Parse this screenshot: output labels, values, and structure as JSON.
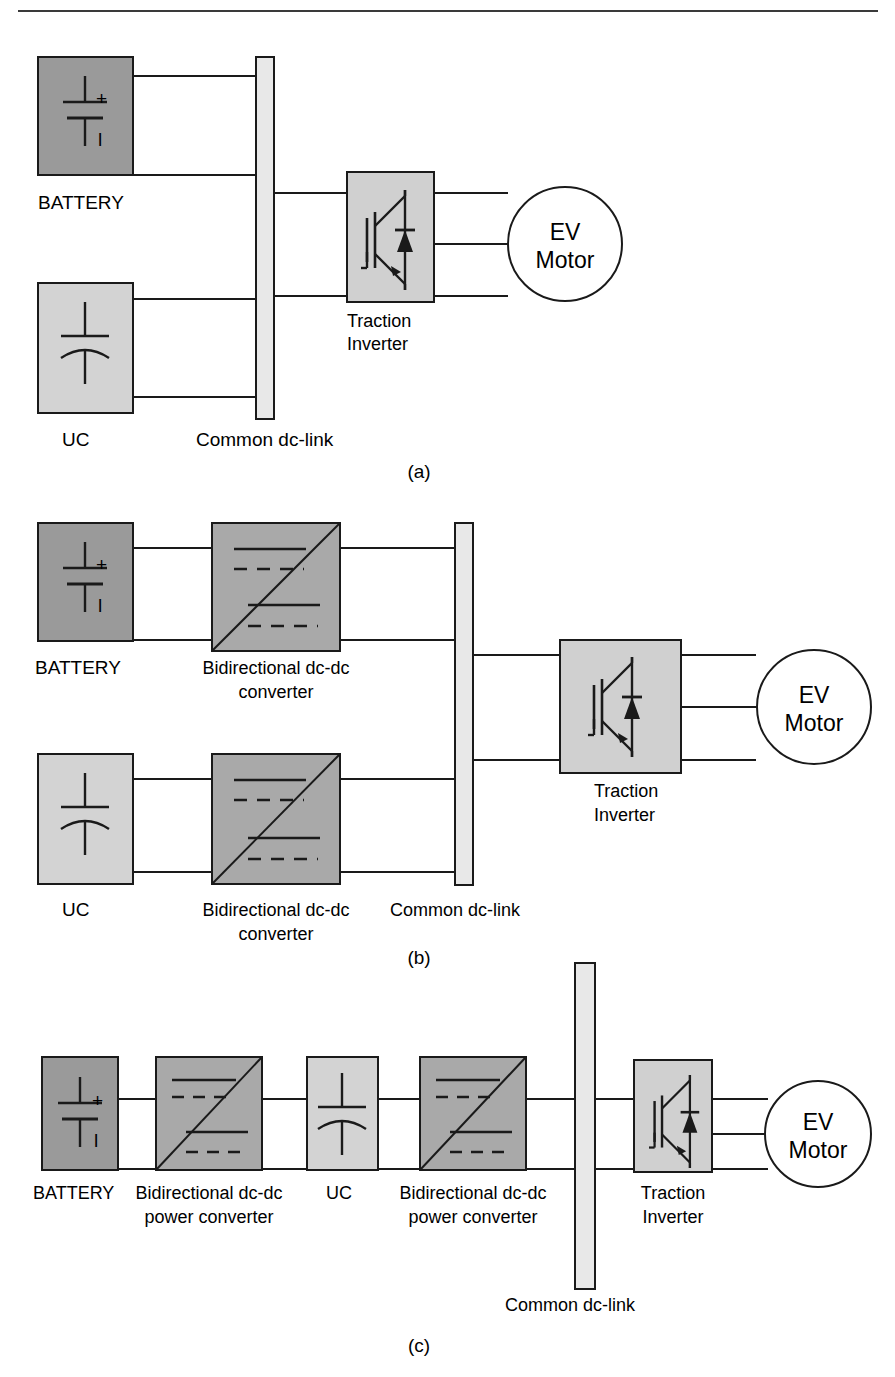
{
  "figure": {
    "top_rule": true,
    "colors": {
      "battery_fill": "#9a9a9a",
      "uc_fill": "#d3d3d3",
      "converter_fill": "#a9a9a9",
      "dclink_fill": "#e8e8e8",
      "inverter_fill": "#d0d0d0",
      "motor_fill": "#ffffff",
      "stroke": "#1a1a1a",
      "background": "#ffffff"
    },
    "panels": [
      {
        "id": "a",
        "caption": "(a)",
        "blocks": [
          {
            "name": "battery",
            "label": "BATTERY",
            "symbol": "battery-symbol",
            "plus": "+",
            "minus": "l"
          },
          {
            "name": "ultracapacitor",
            "label": "UC",
            "symbol": "ultracapacitor-symbol"
          },
          {
            "name": "dc-link",
            "label": "Common dc-link",
            "symbol": "dc-link-bus"
          },
          {
            "name": "traction-inverter",
            "label": "Traction\nInverter",
            "label_line1": "Traction",
            "label_line2": "Inverter",
            "symbol": "igbt-diode-symbol"
          },
          {
            "name": "ev-motor",
            "label_line1": "EV",
            "label_line2": "Motor",
            "symbol": "motor-circle"
          }
        ]
      },
      {
        "id": "b",
        "caption": "(b)",
        "blocks": [
          {
            "name": "battery",
            "label": "BATTERY",
            "symbol": "battery-symbol",
            "plus": "+",
            "minus": "l"
          },
          {
            "name": "battery-dcdc-converter",
            "label_line1": "Bidirectional dc-dc",
            "label_line2": "converter",
            "symbol": "bidirectional-dcdc-symbol"
          },
          {
            "name": "ultracapacitor",
            "label": "UC",
            "symbol": "ultracapacitor-symbol"
          },
          {
            "name": "uc-dcdc-converter",
            "label_line1": "Bidirectional dc-dc",
            "label_line2": "converter",
            "symbol": "bidirectional-dcdc-symbol"
          },
          {
            "name": "dc-link",
            "label": "Common dc-link",
            "symbol": "dc-link-bus"
          },
          {
            "name": "traction-inverter",
            "label_line1": "Traction",
            "label_line2": "Inverter",
            "symbol": "igbt-diode-symbol"
          },
          {
            "name": "ev-motor",
            "label_line1": "EV",
            "label_line2": "Motor",
            "symbol": "motor-circle"
          }
        ]
      },
      {
        "id": "c",
        "caption": "(c)",
        "blocks": [
          {
            "name": "battery",
            "label": "BATTERY",
            "symbol": "battery-symbol",
            "plus": "+",
            "minus": "l"
          },
          {
            "name": "battery-dcdc-converter",
            "label_line1": "Bidirectional dc-dc",
            "label_line2": "power converter",
            "symbol": "bidirectional-dcdc-symbol"
          },
          {
            "name": "ultracapacitor",
            "label": "UC",
            "symbol": "ultracapacitor-symbol"
          },
          {
            "name": "uc-dcdc-converter",
            "label_line1": "Bidirectional dc-dc",
            "label_line2": "power converter",
            "symbol": "bidirectional-dcdc-symbol"
          },
          {
            "name": "dc-link",
            "label": "Common dc-link",
            "symbol": "dc-link-bus"
          },
          {
            "name": "traction-inverter",
            "label_line1": "Traction",
            "label_line2": "Inverter",
            "symbol": "igbt-diode-symbol"
          },
          {
            "name": "ev-motor",
            "label_line1": "EV",
            "label_line2": "Motor",
            "symbol": "motor-circle"
          }
        ]
      }
    ]
  },
  "text": {
    "battery": "BATTERY",
    "uc": "UC",
    "common_dc_link": "Common dc-link",
    "traction": "Traction",
    "inverter": "Inverter",
    "ev": "EV",
    "motor": "Motor",
    "bidirectional_dcdc": "Bidirectional dc-dc",
    "converter": "converter",
    "power_converter": "power converter",
    "plus": "+",
    "minus": "l",
    "caption_a": "(a)",
    "caption_b": "(b)",
    "caption_c": "(c)"
  }
}
